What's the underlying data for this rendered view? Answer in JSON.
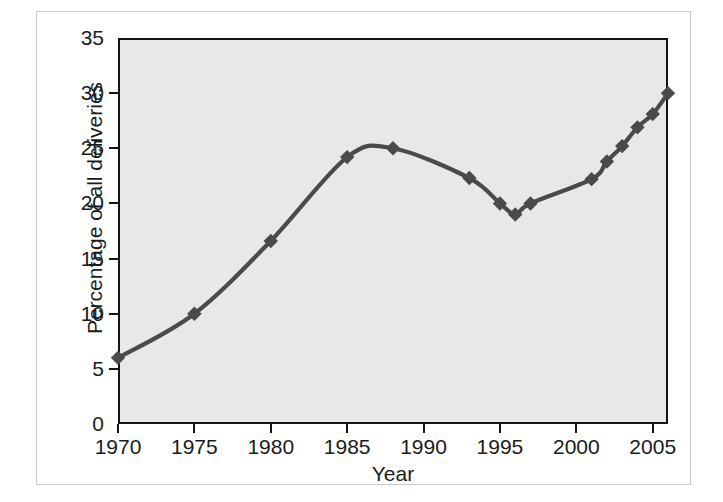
{
  "chart_data": {
    "type": "line",
    "title": "",
    "subtitle": "",
    "xlabel": "Year",
    "ylabel": "Percentage of all deliveries",
    "xlim": [
      1970,
      2006
    ],
    "ylim": [
      0,
      35
    ],
    "grid": false,
    "legend": null,
    "legend_position": "none",
    "xticks": [
      1970,
      1975,
      1980,
      1985,
      1990,
      1995,
      2000,
      2005
    ],
    "xtick_labels": [
      "1970",
      "1975",
      "1980",
      "1985",
      "1990",
      "1995",
      "2000",
      "2005"
    ],
    "yticks": [
      0,
      5,
      10,
      15,
      20,
      25,
      30,
      35
    ],
    "ytick_labels": [
      "0",
      "5",
      "10",
      "15",
      "20",
      "25",
      "30",
      "35"
    ],
    "x": [
      1970,
      1975,
      1980,
      1985,
      1988,
      1993,
      1995,
      1996,
      1997,
      2001,
      2002,
      2003,
      2004,
      2005,
      2006
    ],
    "values": [
      6.0,
      10.0,
      16.6,
      24.2,
      25.0,
      22.3,
      20.0,
      19.0,
      20.0,
      22.2,
      23.8,
      25.2,
      26.9,
      28.1,
      30.0
    ],
    "series": [
      {
        "name": "Percentage of all deliveries",
        "x": [
          1970,
          1975,
          1980,
          1985,
          1988,
          1993,
          1995,
          1996,
          1997,
          2001,
          2002,
          2003,
          2004,
          2005,
          2006
        ],
        "values": [
          6.0,
          10.0,
          16.6,
          24.2,
          25.0,
          22.3,
          20.0,
          19.0,
          20.0,
          22.2,
          23.8,
          25.2,
          26.9,
          28.1,
          30.0
        ],
        "marker": "diamond",
        "line_color": "#4a4a4a",
        "marker_color": "#4a4a4a"
      }
    ],
    "colors": {
      "line": "#4a4a4a",
      "marker": "#4a4a4a",
      "plot_background": "#e8e8e8",
      "axis": "#141414",
      "figure_background": "#ffffff",
      "frame": "#c9c9c9",
      "text": "#1b1b1b"
    }
  }
}
